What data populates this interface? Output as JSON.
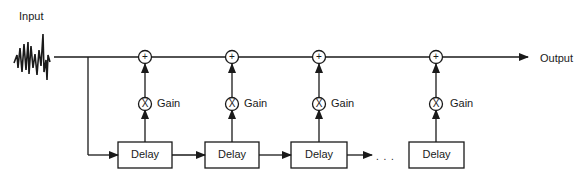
{
  "diagram": {
    "input_label": "Input",
    "output_label": "Output",
    "ellipsis": ". . .",
    "taps": [
      {
        "delay_label": "Delay",
        "gain_label": "Gain",
        "multiply_symbol": "X",
        "sum_symbol": "+"
      },
      {
        "delay_label": "Delay",
        "gain_label": "Gain",
        "multiply_symbol": "X",
        "sum_symbol": "+"
      },
      {
        "delay_label": "Delay",
        "gain_label": "Gain",
        "multiply_symbol": "X",
        "sum_symbol": "+"
      },
      {
        "delay_label": "Delay",
        "gain_label": "Gain",
        "multiply_symbol": "X",
        "sum_symbol": "+"
      }
    ],
    "colors": {
      "stroke": "#1a1a1a",
      "background": "#ffffff"
    }
  }
}
